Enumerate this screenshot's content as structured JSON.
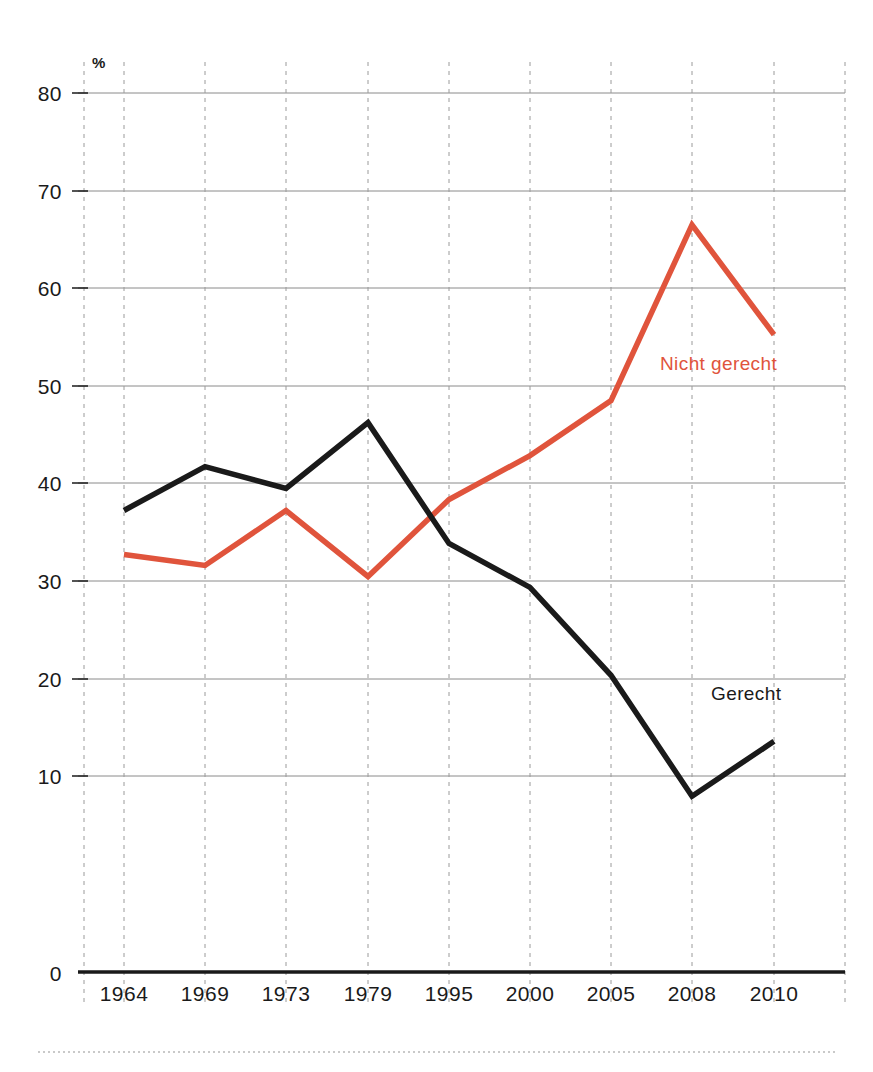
{
  "chart_data": {
    "type": "line",
    "title": "",
    "subtitle": "",
    "xlabel": "",
    "ylabel": "",
    "unit_label": "%",
    "categories": [
      "1964",
      "1969",
      "1973",
      "1979",
      "1995",
      "2000",
      "2005",
      "2008",
      "2010"
    ],
    "ylim": [
      0,
      80
    ],
    "y_ticks": [
      "0",
      "10",
      "20",
      "30",
      "40",
      "50",
      "60",
      "70",
      "80"
    ],
    "grid": "horizontal-solid-and-vertical-dashed",
    "legend_position": "inline-annotations",
    "series": [
      {
        "name": "Gerecht",
        "color": "#1a1a1a",
        "values": [
          42,
          46,
          44,
          50,
          39,
          35,
          27,
          16,
          21
        ],
        "label_text": "Gerecht"
      },
      {
        "name": "Nicht gerecht",
        "color": "#e0543c",
        "values": [
          38,
          37,
          42,
          36,
          43,
          47,
          52,
          68,
          58
        ],
        "label_text": "Nicht gerecht"
      }
    ]
  },
  "annotations": {
    "nicht_gerecht_label": "Nicht gerecht",
    "gerecht_label": "Gerecht"
  },
  "colors": {
    "accent_orange": "#e0543c",
    "line_black": "#1a1a1a",
    "gridline": "#8a8a8a",
    "gridline_dashed": "#9a9a9a",
    "background": "#ffffff"
  }
}
